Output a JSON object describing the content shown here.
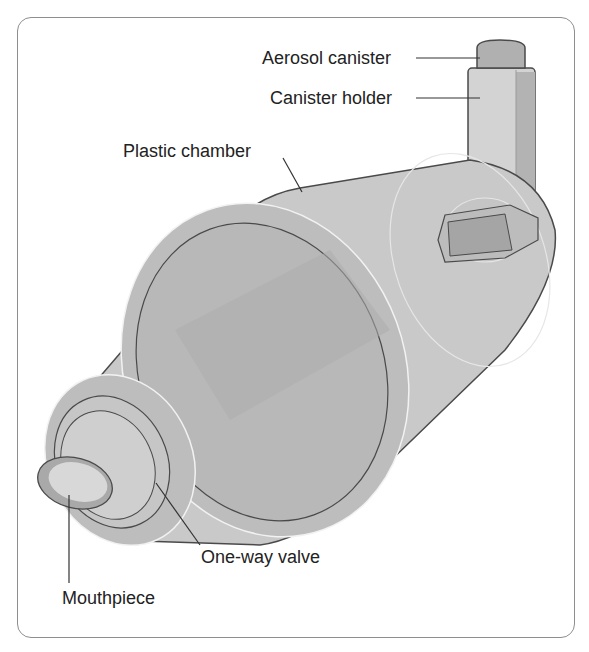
{
  "diagram": {
    "labels": {
      "aerosol_canister": "Aerosol canister",
      "canister_holder": "Canister holder",
      "plastic_chamber": "Plastic chamber",
      "one_way_valve": "One-way valve",
      "mouthpiece": "Mouthpiece"
    },
    "colors": {
      "frame": "#8e8e8e",
      "body_fill": "#c9c9c9",
      "body_dark": "#a9a9a9",
      "outline": "#4a4a4a",
      "highlight": "#f2f2f2",
      "text": "#222222"
    }
  }
}
